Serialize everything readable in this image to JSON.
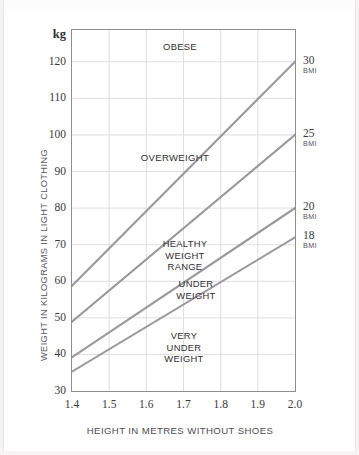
{
  "page": {
    "title_cropped": "FORMULA FOR CALCULATING HEALTHY WEIGHT RANGE"
  },
  "chart_data": {
    "type": "line",
    "title": "FORMULA FOR CALCULATING HEALTHY WEIGHT RANGE",
    "xlabel": "HEIGHT IN METRES WITHOUT SHOES",
    "ylabel": "WEIGHT IN KILOGRAMS IN LIGHT CLOTHING",
    "yunit": "kg",
    "grid": true,
    "legend_position": "none",
    "xlim": [
      1.4,
      2.0
    ],
    "ylim": [
      30,
      128.7
    ],
    "xticks": [
      "1.4",
      "1.5",
      "1.6",
      "1.7",
      "1.8",
      "1.9",
      "2.0"
    ],
    "yticks": [
      "30",
      "40",
      "50",
      "60",
      "70",
      "80",
      "90",
      "100",
      "110",
      "120"
    ],
    "right_axis_label": "BMI",
    "right_axis_ticks": [
      {
        "value": "30",
        "unit": "BMI"
      },
      {
        "value": "25",
        "unit": "BMI"
      },
      {
        "value": "20",
        "unit": "BMI"
      },
      {
        "value": "18",
        "unit": "BMI"
      }
    ],
    "series": [
      {
        "name": "BMI 30",
        "bmi": 30,
        "x": [
          1.4,
          2.0
        ],
        "values": [
          58.8,
          120.0
        ]
      },
      {
        "name": "BMI 25",
        "bmi": 25,
        "x": [
          1.4,
          2.0
        ],
        "values": [
          49.0,
          100.0
        ]
      },
      {
        "name": "BMI 20",
        "bmi": 20,
        "x": [
          1.4,
          2.0
        ],
        "values": [
          39.2,
          80.0
        ]
      },
      {
        "name": "BMI 18",
        "bmi": 18,
        "x": [
          1.4,
          2.0
        ],
        "values": [
          35.3,
          72.0
        ]
      }
    ],
    "annotations": [
      {
        "text": "OBESE",
        "zone": "above BMI 30"
      },
      {
        "text": "OVERWEIGHT",
        "zone": "BMI 25 to 30"
      },
      {
        "text": "HEALTHY\nWEIGHT\nRANGE",
        "zone": "BMI 20 to 25"
      },
      {
        "text": "UNDER\nWEIGHT",
        "zone": "BMI 18 to 20"
      },
      {
        "text": "VERY\nUNDER\nWEIGHT",
        "zone": "below BMI 18"
      }
    ],
    "colors": {
      "line": "#9a989e",
      "grid": "#e0dedf",
      "axis": "#8f8d93",
      "text": "#3a3940"
    }
  }
}
